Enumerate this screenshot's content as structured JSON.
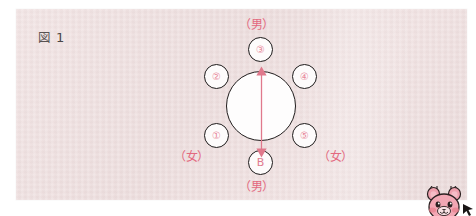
{
  "figure": {
    "caption_glyph": "図",
    "caption_number": "1"
  },
  "colors": {
    "panel_background": "#eedfdf",
    "page_background": "#ffffff",
    "node_stroke": "#1d1a1a",
    "node_fill": "#fdfbfb",
    "accent_red": "#e3697f",
    "arrow_red": "#e0798c",
    "caption_text": "#4a4646",
    "mascot_pink": "#f0a0ae"
  },
  "diagram": {
    "type": "seating-circle",
    "center_node": {
      "name": "center-table",
      "shape": "circle",
      "label": ""
    },
    "axis_arrow": {
      "name": "vertical-double-arrow",
      "direction": "both",
      "orientation": "vertical"
    },
    "nodes": [
      {
        "id": "node-3",
        "label": "③",
        "position": "top"
      },
      {
        "id": "node-2",
        "label": "②",
        "position": "upper-left"
      },
      {
        "id": "node-4",
        "label": "④",
        "position": "upper-right"
      },
      {
        "id": "node-1",
        "label": "①",
        "position": "lower-left"
      },
      {
        "id": "node-5",
        "label": "⑤",
        "position": "lower-right"
      },
      {
        "id": "node-b",
        "label": "B",
        "position": "bottom"
      }
    ],
    "labels": [
      {
        "id": "label-top",
        "text": "（男）",
        "position": "top"
      },
      {
        "id": "label-bottom",
        "text": "（男）",
        "position": "bottom"
      },
      {
        "id": "label-left",
        "text": "（女）",
        "position": "left"
      },
      {
        "id": "label-right",
        "text": "（女）",
        "position": "right"
      }
    ]
  },
  "mascot": {
    "name": "bear-mascot",
    "description": "pink bear character, partially cropped at bottom-right"
  }
}
